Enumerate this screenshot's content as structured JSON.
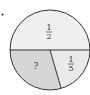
{
  "diagram": {
    "type": "circle-fraction-partition",
    "marker": "•",
    "regions": [
      {
        "id": "top-half",
        "label_num": "1",
        "label_den": "2",
        "fill": "#efefef"
      },
      {
        "id": "bottom-right",
        "label_num": "1",
        "label_den": "5",
        "fill": "#eaeaea"
      },
      {
        "id": "bottom-left",
        "label": "?",
        "fill": "#d6d6d6"
      }
    ],
    "stroke": "#333333"
  }
}
